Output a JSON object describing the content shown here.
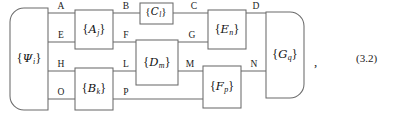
{
  "figure": {
    "equation_number": "(3.2)",
    "trailing_punctuation": ",",
    "background_color": "#ffffff",
    "line_color": "#6b6b6b",
    "text_color": "#1a1a1a"
  },
  "nodes": [
    {
      "id": "psi",
      "name": "state-box-psi",
      "symbol": "{Ψi}",
      "base": "Ψ",
      "subscript": "i",
      "shape": "rounded-left",
      "x": 10,
      "y": 8,
      "w": 38,
      "h": 102
    },
    {
      "id": "A",
      "name": "operator-box-a",
      "symbol": "{Aj}",
      "base": "A",
      "subscript": "j",
      "shape": "rect",
      "x": 75,
      "y": 10,
      "w": 38,
      "h": 39
    },
    {
      "id": "C",
      "name": "operator-box-c",
      "symbol": "{Cl}",
      "base": "C",
      "subscript": "l",
      "shape": "rect",
      "x": 140,
      "y": 3,
      "w": 33,
      "h": 21
    },
    {
      "id": "D",
      "name": "operator-box-d",
      "symbol": "{Dm}",
      "base": "D",
      "subscript": "m",
      "shape": "rect",
      "x": 136,
      "y": 40,
      "w": 42,
      "h": 45
    },
    {
      "id": "E",
      "name": "operator-box-e",
      "symbol": "{En}",
      "base": "E",
      "subscript": "n",
      "shape": "rect",
      "x": 208,
      "y": 10,
      "w": 38,
      "h": 39
    },
    {
      "id": "B",
      "name": "operator-box-b",
      "symbol": "{Bk}",
      "base": "B",
      "subscript": "k",
      "shape": "rect",
      "x": 75,
      "y": 68,
      "w": 38,
      "h": 42
    },
    {
      "id": "F",
      "name": "operator-box-f",
      "symbol": "{Fp}",
      "base": "F",
      "subscript": "p",
      "shape": "rect",
      "x": 203,
      "y": 66,
      "w": 38,
      "h": 42
    },
    {
      "id": "G",
      "name": "operator-box-g",
      "symbol": "{Gq}",
      "base": "G",
      "subscript": "q",
      "shape": "rounded-right",
      "x": 266,
      "y": 12,
      "w": 38,
      "h": 86
    }
  ],
  "edge_labels": [
    {
      "id": "A",
      "name": "edge-label-a",
      "text": "A",
      "x": 61,
      "y": 9
    },
    {
      "id": "B",
      "name": "edge-label-b",
      "text": "B",
      "x": 126,
      "y": 9
    },
    {
      "id": "C",
      "name": "edge-label-c",
      "text": "C",
      "x": 194,
      "y": 9
    },
    {
      "id": "D",
      "name": "edge-label-d",
      "text": "D",
      "x": 256,
      "y": 9
    },
    {
      "id": "E",
      "name": "edge-label-e",
      "text": "E",
      "x": 61,
      "y": 38
    },
    {
      "id": "F",
      "name": "edge-label-f",
      "text": "F",
      "x": 126,
      "y": 38
    },
    {
      "id": "G",
      "name": "edge-label-g",
      "text": "G",
      "x": 192,
      "y": 38
    },
    {
      "id": "H",
      "name": "edge-label-h",
      "text": "H",
      "x": 61,
      "y": 67
    },
    {
      "id": "L",
      "name": "edge-label-l",
      "text": "L",
      "x": 126,
      "y": 67
    },
    {
      "id": "M",
      "name": "edge-label-m",
      "text": "M",
      "x": 190,
      "y": 67
    },
    {
      "id": "N",
      "name": "edge-label-n",
      "text": "N",
      "x": 254,
      "y": 67
    },
    {
      "id": "O",
      "name": "edge-label-o",
      "text": "O",
      "x": 61,
      "y": 95
    },
    {
      "id": "P",
      "name": "edge-label-p",
      "text": "P",
      "x": 126,
      "y": 95
    }
  ],
  "wires": [
    {
      "name": "wire-psi-A",
      "d": "M48,13 H75"
    },
    {
      "name": "wire-A-C",
      "d": "M113,13 H140"
    },
    {
      "name": "wire-C-E",
      "d": "M173,13 H208"
    },
    {
      "name": "wire-E-G",
      "d": "M246,13 H266"
    },
    {
      "name": "wire-psi-E",
      "d": "M48,42 H75"
    },
    {
      "name": "wire-A-F",
      "d": "M113,42 H136"
    },
    {
      "name": "wire-D-G-up",
      "d": "M178,42 H208"
    },
    {
      "name": "wire-psi-H",
      "d": "M48,71 H75"
    },
    {
      "name": "wire-B-L",
      "d": "M113,71 H136"
    },
    {
      "name": "wire-D-M",
      "d": "M178,71 H203"
    },
    {
      "name": "wire-F-N",
      "d": "M241,71 H266"
    },
    {
      "name": "wire-psi-O",
      "d": "M48,99 H75"
    },
    {
      "name": "wire-B-P",
      "d": "M113,99 H203"
    }
  ],
  "equation": {
    "label": "(3.2)",
    "x": 356,
    "y": 53
  },
  "comma": {
    "text": ",",
    "x": 314,
    "y": 61
  }
}
